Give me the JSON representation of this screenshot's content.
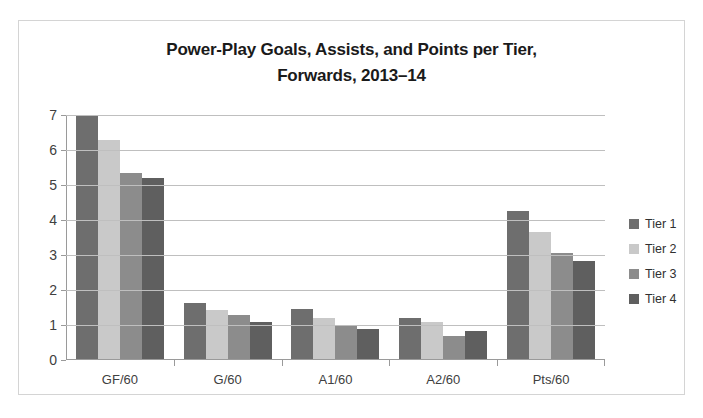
{
  "chart_data": {
    "type": "bar",
    "title": "Power-Play Goals, Assists, and Points per Tier, Forwards, 2013–14",
    "title_line1": "Power-Play Goals, Assists, and Points per Tier,",
    "title_line2": "Forwards, 2013–14",
    "xlabel": "",
    "ylabel": "",
    "ylim": [
      0,
      7
    ],
    "ytick_labels": [
      "7",
      "6",
      "5",
      "4",
      "3",
      "2",
      "1",
      "0"
    ],
    "ytick_values": [
      7,
      6,
      5,
      4,
      3,
      2,
      1,
      0
    ],
    "grid": true,
    "legend_position": "right",
    "categories": [
      "GF/60",
      "G/60",
      "A1/60",
      "A2/60",
      "Pts/60"
    ],
    "series": [
      {
        "name": "Tier 1",
        "color": "#6e6e6e",
        "values": [
          7.0,
          1.63,
          1.45,
          1.2,
          4.25
        ]
      },
      {
        "name": "Tier 2",
        "color": "#c9c9c9",
        "values": [
          6.3,
          1.42,
          1.2,
          1.1,
          3.67
        ]
      },
      {
        "name": "Tier 3",
        "color": "#8c8c8c",
        "values": [
          5.35,
          1.3,
          1.0,
          0.68,
          3.05
        ]
      },
      {
        "name": "Tier 4",
        "color": "#5f5f5f",
        "values": [
          5.2,
          1.1,
          0.9,
          0.82,
          2.82
        ]
      }
    ]
  },
  "colors": {
    "frame_border": "#d4d4d4",
    "gridline": "#bfbfbf",
    "axis": "#9a9a9a",
    "title_text": "#1a1a1a",
    "tick_text": "#404040"
  }
}
